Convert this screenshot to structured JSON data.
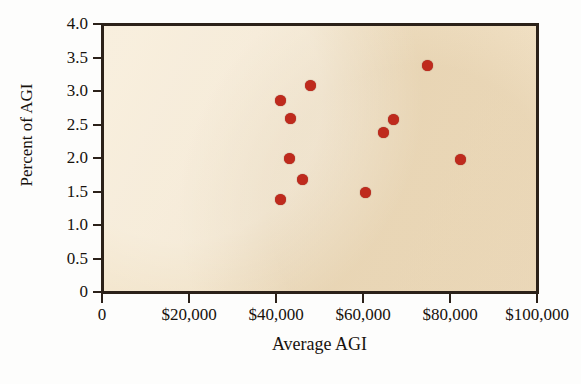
{
  "chart_data": {
    "type": "scatter",
    "title": "",
    "xlabel": "Average AGI",
    "ylabel": "Percent of AGI",
    "xlim": [
      0,
      100000
    ],
    "ylim": [
      0,
      4.0
    ],
    "grid": false,
    "legend": null,
    "point_color": "#bf2a1d",
    "plot_background_color": "#f2e2c6",
    "axis_color": "#2b2119",
    "x_tick_labels": [
      "0",
      "$20,000",
      "$40,000",
      "$60,000",
      "$80,000",
      "$100,000"
    ],
    "x_tick_values": [
      0,
      20000,
      40000,
      60000,
      80000,
      100000
    ],
    "y_tick_labels": [
      "0",
      "0.5",
      "1.0",
      "1.5",
      "2.0",
      "2.5",
      "3.0",
      "3.5",
      "4.0"
    ],
    "y_tick_values": [
      0,
      0.5,
      1.0,
      1.5,
      2.0,
      2.5,
      3.0,
      3.5,
      4.0
    ],
    "points": [
      {
        "x": 41000,
        "y": 2.86
      },
      {
        "x": 43400,
        "y": 2.59
      },
      {
        "x": 48000,
        "y": 3.08
      },
      {
        "x": 43200,
        "y": 1.99
      },
      {
        "x": 46200,
        "y": 1.68
      },
      {
        "x": 41100,
        "y": 1.38
      },
      {
        "x": 60500,
        "y": 1.48
      },
      {
        "x": 64600,
        "y": 2.38
      },
      {
        "x": 67100,
        "y": 2.58
      },
      {
        "x": 74900,
        "y": 3.38
      },
      {
        "x": 82300,
        "y": 1.98
      }
    ]
  }
}
